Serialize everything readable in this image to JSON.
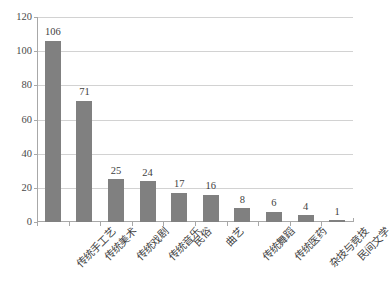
{
  "chart_data": {
    "type": "bar",
    "title": "",
    "subtitle": "",
    "xlabel": "",
    "ylabel": "",
    "categories": [
      "传统手工艺",
      "传统美术",
      "传统戏剧",
      "传统音乐",
      "民俗",
      "曲艺",
      "传统舞蹈",
      "传统医药",
      "杂技与竞技",
      "民间文学"
    ],
    "values": [
      106,
      71,
      25,
      24,
      17,
      16,
      8,
      6,
      4,
      1
    ],
    "data_labels": [
      "106",
      "71",
      "25",
      "24",
      "17",
      "16",
      "8",
      "6",
      "4",
      "1"
    ],
    "ylim": [
      0,
      120
    ],
    "ytick_values": [
      0,
      20,
      40,
      60,
      80,
      100,
      120
    ],
    "ytick_labels": [
      "0",
      "20",
      "40",
      "60",
      "80",
      "100",
      "120"
    ],
    "ytick_step": 20,
    "grid": "horizontal",
    "legend": "none",
    "series": [
      {
        "name": "",
        "values": [
          106,
          71,
          25,
          24,
          17,
          16,
          8,
          6,
          4,
          1
        ],
        "color": "#808080"
      }
    ],
    "bar_color": "#808080",
    "gridline_color": "#d2d2d2",
    "axis_color": "#a8a8a8",
    "label_color": "#3f3f3f",
    "x_label_rotation": -45
  }
}
